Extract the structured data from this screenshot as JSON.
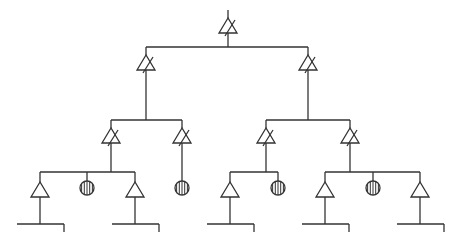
{
  "diagram": {
    "type": "tree-network",
    "colors": {
      "stroke": "#333333",
      "background": "#ffffff"
    },
    "root": {
      "symbol": "variable-amplifier",
      "x": 228,
      "y_top": 18,
      "y_bottom": 47
    },
    "levels": [
      {
        "bar_y": 47,
        "x_from": 146,
        "x_to": 308
      },
      {
        "bar_y": 120,
        "x_from": 111,
        "x_to": 182
      },
      {
        "bar_y": 120,
        "x_from": 266,
        "x_to": 350
      }
    ],
    "level2_amplifiers": [
      {
        "x": 146,
        "symbol": "variable-amplifier"
      },
      {
        "x": 308,
        "symbol": "variable-amplifier"
      }
    ],
    "level3_amplifiers": [
      {
        "x": 111,
        "symbol": "variable-amplifier"
      },
      {
        "x": 182,
        "symbol": "variable-amplifier"
      },
      {
        "x": 266,
        "symbol": "variable-amplifier"
      },
      {
        "x": 350,
        "symbol": "variable-amplifier"
      }
    ],
    "leaf_groups": [
      {
        "parent_x": 111,
        "bar_y": 172,
        "x_from": 40,
        "x_to": 135,
        "children": [
          {
            "x": 40,
            "symbol": "amplifier"
          },
          {
            "x": 87,
            "symbol": "termination"
          },
          {
            "x": 135,
            "symbol": "amplifier"
          }
        ]
      },
      {
        "parent_x": 182,
        "bar_y": null,
        "x_from": 182,
        "x_to": 182,
        "children": [
          {
            "x": 182,
            "symbol": "termination"
          }
        ]
      },
      {
        "parent_x": 266,
        "bar_y": 172,
        "x_from": 230,
        "x_to": 278,
        "children": [
          {
            "x": 230,
            "symbol": "amplifier"
          },
          {
            "x": 278,
            "symbol": "termination"
          }
        ]
      },
      {
        "parent_x": 350,
        "bar_y": 172,
        "x_from": 325,
        "x_to": 420,
        "children": [
          {
            "x": 325,
            "symbol": "amplifier"
          },
          {
            "x": 373,
            "symbol": "termination"
          },
          {
            "x": 420,
            "symbol": "amplifier"
          }
        ]
      }
    ],
    "outputs": [
      {
        "stem_x": 40,
        "y": 224,
        "x_from": 17,
        "x_to": 64
      },
      {
        "stem_x": 135,
        "y": 224,
        "x_from": 112,
        "x_to": 159
      },
      {
        "stem_x": 230,
        "y": 224,
        "x_from": 207,
        "x_to": 254
      },
      {
        "stem_x": 325,
        "y": 224,
        "x_from": 302,
        "x_to": 349
      },
      {
        "stem_x": 420,
        "y": 224,
        "x_from": 397,
        "x_to": 444
      }
    ],
    "labels": []
  }
}
